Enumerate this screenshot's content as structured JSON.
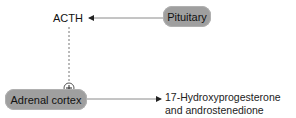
{
  "diagram": {
    "nodes": {
      "pituitary": {
        "label": "Pituitary"
      },
      "acth": {
        "label": "ACTH"
      },
      "adrenal_cortex": {
        "label": "Adrenal cortex"
      },
      "product": {
        "line1": "17-Hydroxyprogesterone",
        "line2": "and androstenedione"
      }
    },
    "edges": [
      {
        "from": "Pituitary",
        "to": "ACTH",
        "style": "solid-arrow"
      },
      {
        "from": "ACTH",
        "to": "Adrenal cortex",
        "style": "dashed",
        "effect": "+"
      },
      {
        "from": "Adrenal cortex",
        "to": "17-Hydroxyprogesterone and androstenedione",
        "style": "solid-arrow"
      }
    ],
    "stimulation_symbol": "+",
    "colors": {
      "node_fill": "#9f9f9f",
      "line": "#888888",
      "text": "#111111"
    }
  }
}
